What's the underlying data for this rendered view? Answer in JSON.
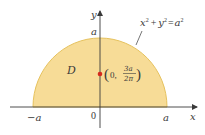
{
  "diagram": {
    "region": {
      "label": "D",
      "shape": "upper semicircle",
      "fill_color": "#f7dc97",
      "edge_color": "#e6c25e"
    },
    "curve_equation": {
      "x": "x",
      "x_exp": "2",
      "plus": "+",
      "y": "y",
      "y_exp": "2",
      "equals": "=",
      "a": "a",
      "a_exp": "2"
    },
    "axes": {
      "x_label": "x",
      "y_label": "y",
      "origin_label": "0",
      "neg_a_label": "−a",
      "pos_a_label": "a",
      "top_a_label": "a",
      "axis_color": "#3a3a3a"
    },
    "centroid": {
      "open_paren": "(",
      "x_value": "0,",
      "numerator": "3a",
      "denominator": "2π",
      "close_paren": ")",
      "dot_color": "#d42a1e"
    }
  }
}
